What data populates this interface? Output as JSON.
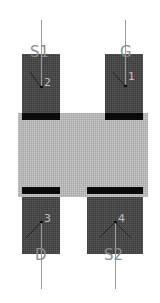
{
  "component": {
    "type": "footprint",
    "body": {
      "x": 18,
      "y": 113,
      "width": 130,
      "height": 84,
      "color": "#b8b8b8"
    },
    "band_color": "#0a0a0a",
    "pad_color": "#4a4a4a",
    "lead_color": "#9a9a9a"
  },
  "pads": [
    {
      "name": "S1",
      "pin": "2",
      "x": 22,
      "y": 54,
      "w": 38,
      "h": 64,
      "lead_x": 41,
      "lead_y1": 20,
      "lead_y2": 87,
      "label_y": 51,
      "pin_x": 45,
      "pin_y": 84
    },
    {
      "name": "G",
      "pin": "1",
      "x": 105,
      "y": 54,
      "w": 38,
      "h": 64,
      "lead_x": 125,
      "lead_y1": 20,
      "lead_y2": 86,
      "label_y": 51,
      "pin_x": 128,
      "pin_y": 74
    },
    {
      "name": "D",
      "pin": "3",
      "x": 22,
      "y": 187,
      "w": 38,
      "h": 67,
      "lead_x": 41,
      "lead_y1": 222,
      "lead_y2": 289,
      "label_y": 265,
      "pin_x": 46,
      "pin_y": 217
    },
    {
      "name": "S2",
      "pin": "4",
      "x": 87,
      "y": 187,
      "w": 56,
      "h": 67,
      "lead_x": 115,
      "lead_y1": 222,
      "lead_y2": 289,
      "label_y": 265,
      "pin_x": 120,
      "pin_y": 217
    }
  ],
  "labels": {
    "s1": "S1",
    "g": "G",
    "d": "D",
    "s2": "S2",
    "pin1": "1",
    "pin2": "2",
    "pin3": "3",
    "pin4": "4"
  }
}
